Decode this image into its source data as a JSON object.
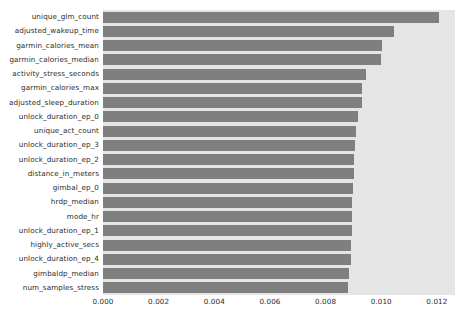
{
  "chart_data": {
    "type": "bar",
    "orientation": "horizontal",
    "title": "",
    "xlabel": "",
    "ylabel": "",
    "xlim": [
      0.0,
      0.01265
    ],
    "xticks": [
      0.0,
      0.002,
      0.004,
      0.006,
      0.008,
      0.01,
      0.012
    ],
    "xticklabels": [
      "0.000",
      "0.002",
      "0.004",
      "0.006",
      "0.008",
      "0.010",
      "0.012"
    ],
    "grid": false,
    "legend": false,
    "bar_color": "#7f7f7f",
    "axes_facecolor": "#e5e5e5",
    "figure_facecolor": "#ffffff",
    "categories": [
      "unique_glm_count",
      "adjusted_wakeup_time",
      "garmin_calories_mean",
      "garmin_calories_median",
      "activity_stress_seconds",
      "garmin_calories_max",
      "adjusted_sleep_duration",
      "unlock_duration_ep_0",
      "unique_act_count",
      "unlock_duration_ep_3",
      "unlock_duration_ep_2",
      "distance_in_meters",
      "gimbal_ep_0",
      "hrdp_median",
      "mode_hr",
      "unlock_duration_ep_1",
      "highly_active_secs",
      "unlock_duration_ep_4",
      "gimbaldp_median",
      "num_samples_stress"
    ],
    "values": [
      0.01209,
      0.01047,
      0.01001,
      0.01,
      0.00946,
      0.00932,
      0.00931,
      0.00915,
      0.00908,
      0.00905,
      0.00903,
      0.00901,
      0.00898,
      0.00896,
      0.00895,
      0.00894,
      0.00893,
      0.00892,
      0.00884,
      0.00882
    ]
  }
}
